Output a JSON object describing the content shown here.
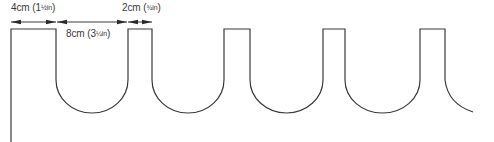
{
  "title": "",
  "colors": {
    "line": "#3a3a3a",
    "text": "#3a3a3a",
    "background": "#ffffff"
  },
  "dimensions": [
    {
      "id": "tooth-width",
      "label": "4cm (1",
      "fraction": "½in",
      "close": ")",
      "x_start": 11,
      "x_end": 56
    },
    {
      "id": "gap-width",
      "label": "8cm (3",
      "fraction": "¼in",
      "close": ")",
      "x_start": 56,
      "x_end": 128
    },
    {
      "id": "narrow-tooth-width",
      "label": "2cm (",
      "fraction": "¾in",
      "close": ")",
      "x_start": 128,
      "x_end": 152
    }
  ],
  "shape": {
    "description": "Scalloped edge template: flat-topped rectangular tabs separated by semicircular U-shaped cut-outs",
    "teeth": [
      {
        "left": 11,
        "right": 56
      },
      {
        "left": 128,
        "right": 152
      },
      {
        "left": 224,
        "right": 250
      },
      {
        "left": 323,
        "right": 345
      },
      {
        "left": 420,
        "right": 445
      }
    ],
    "top_y": 29,
    "curve_start_y": 80,
    "bottom_y": 112,
    "left_edge_bottom_y": 142
  }
}
